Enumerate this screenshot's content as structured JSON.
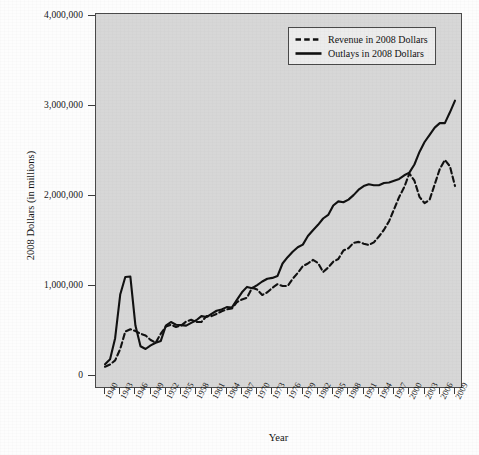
{
  "chart_data": {
    "type": "line",
    "title": "",
    "xlabel": "Year",
    "ylabel": "2008 Dollars (in millions)",
    "xlim": [
      1940,
      2009
    ],
    "ylim": [
      0,
      4000000
    ],
    "grid": false,
    "plot_background": "#d7d7d7",
    "legend_position": "top-right",
    "y_ticks": [
      {
        "value": 0,
        "label": "0"
      },
      {
        "value": 1000000,
        "label": "1,000,000"
      },
      {
        "value": 2000000,
        "label": "2,000,000"
      },
      {
        "value": 3000000,
        "label": "3,000,000"
      },
      {
        "value": 4000000,
        "label": "4,000,000"
      }
    ],
    "x_ticks": [
      {
        "value": 1940,
        "label": "1940"
      },
      {
        "value": 1943,
        "label": "1943"
      },
      {
        "value": 1946,
        "label": "1946"
      },
      {
        "value": 1949,
        "label": "1949"
      },
      {
        "value": 1952,
        "label": "1952"
      },
      {
        "value": 1955,
        "label": "1955"
      },
      {
        "value": 1958,
        "label": "1958"
      },
      {
        "value": 1961,
        "label": "1961"
      },
      {
        "value": 1964,
        "label": "1964"
      },
      {
        "value": 1967,
        "label": "1967"
      },
      {
        "value": 1970,
        "label": "1970"
      },
      {
        "value": 1973,
        "label": "1973"
      },
      {
        "value": 1976,
        "label": "1976"
      },
      {
        "value": 1979,
        "label": "1979"
      },
      {
        "value": 1982,
        "label": "1982"
      },
      {
        "value": 1985,
        "label": "1985"
      },
      {
        "value": 1988,
        "label": "1988"
      },
      {
        "value": 1991,
        "label": "1991"
      },
      {
        "value": 1994,
        "label": "1994"
      },
      {
        "value": 1997,
        "label": "1997"
      },
      {
        "value": 2000,
        "label": "2000"
      },
      {
        "value": 2003,
        "label": "2003"
      },
      {
        "value": 2006,
        "label": "2006"
      },
      {
        "value": 2009,
        "label": "2009"
      }
    ],
    "x": [
      1940,
      1941,
      1942,
      1943,
      1944,
      1945,
      1946,
      1947,
      1948,
      1949,
      1950,
      1951,
      1952,
      1953,
      1954,
      1955,
      1956,
      1957,
      1958,
      1959,
      1960,
      1961,
      1962,
      1963,
      1964,
      1965,
      1966,
      1967,
      1968,
      1969,
      1970,
      1971,
      1972,
      1973,
      1974,
      1975,
      1976,
      1977,
      1978,
      1979,
      1980,
      1981,
      1982,
      1983,
      1984,
      1985,
      1986,
      1987,
      1988,
      1989,
      1990,
      1991,
      1992,
      1993,
      1994,
      1995,
      1996,
      1997,
      1998,
      1999,
      2000,
      2001,
      2002,
      2003,
      2004,
      2005,
      2006,
      2007,
      2008,
      2009
    ],
    "series": [
      {
        "name": "Revenue in 2008 Dollars",
        "style": "dashed",
        "color": "#111111",
        "values": [
          103000,
          128000,
          173000,
          300000,
          494000,
          520000,
          500000,
          470000,
          450000,
          400000,
          370000,
          470000,
          550000,
          570000,
          545000,
          560000,
          605000,
          625000,
          600000,
          600000,
          665000,
          665000,
          690000,
          720000,
          740000,
          750000,
          820000,
          850000,
          870000,
          980000,
          960000,
          900000,
          930000,
          980000,
          1020000,
          1000000,
          1000000,
          1080000,
          1145000,
          1220000,
          1250000,
          1290000,
          1255000,
          1155000,
          1205000,
          1270000,
          1300000,
          1395000,
          1420000,
          1480000,
          1490000,
          1470000,
          1455000,
          1485000,
          1550000,
          1625000,
          1720000,
          1855000,
          1990000,
          2100000,
          2250000,
          2170000,
          1990000,
          1920000,
          1960000,
          2130000,
          2300000,
          2400000,
          2330000,
          2110000
        ]
      },
      {
        "name": "Outlays in 2008 Dollars",
        "style": "solid",
        "color": "#111111",
        "values": [
          130000,
          185000,
          420000,
          905000,
          1100000,
          1105000,
          560000,
          330000,
          300000,
          340000,
          370000,
          390000,
          560000,
          600000,
          570000,
          565000,
          560000,
          590000,
          620000,
          665000,
          655000,
          690000,
          725000,
          740000,
          765000,
          760000,
          845000,
          930000,
          990000,
          975000,
          1010000,
          1050000,
          1080000,
          1090000,
          1110000,
          1250000,
          1320000,
          1380000,
          1430000,
          1460000,
          1555000,
          1620000,
          1680000,
          1750000,
          1790000,
          1895000,
          1940000,
          1930000,
          1960000,
          2010000,
          2070000,
          2110000,
          2130000,
          2120000,
          2120000,
          2145000,
          2150000,
          2170000,
          2190000,
          2230000,
          2260000,
          2350000,
          2490000,
          2600000,
          2680000,
          2760000,
          2810000,
          2810000,
          2930000,
          3060000
        ]
      }
    ],
    "annotations": []
  },
  "legend": {
    "entries": [
      {
        "label": "Revenue in 2008 Dollars",
        "style": "dashed"
      },
      {
        "label": "Outlays in 2008 Dollars",
        "style": "solid"
      }
    ]
  }
}
